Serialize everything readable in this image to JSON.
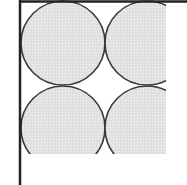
{
  "diagram": {
    "colors": {
      "background": "#ffffff",
      "circle_fill": "#e4e4e4",
      "circle_stroke": "#3a3a3a",
      "axis_line": "#222222"
    },
    "axes": {
      "vertical": {
        "x": 20,
        "y1": 0,
        "y2": 185
      },
      "horizontal": {
        "y": 1.5,
        "x1": 20,
        "x2": 187
      }
    },
    "clip": {
      "x": 20,
      "y": 0,
      "width": 146,
      "height": 154
    },
    "circle_radius": 42,
    "circles": [
      {
        "id": "circle-top-left",
        "cx": 63,
        "cy": 43
      },
      {
        "id": "circle-top-right",
        "cx": 147,
        "cy": 43
      },
      {
        "id": "circle-bottom-left",
        "cx": 63,
        "cy": 128
      },
      {
        "id": "circle-bottom-right",
        "cx": 147,
        "cy": 128
      }
    ]
  }
}
